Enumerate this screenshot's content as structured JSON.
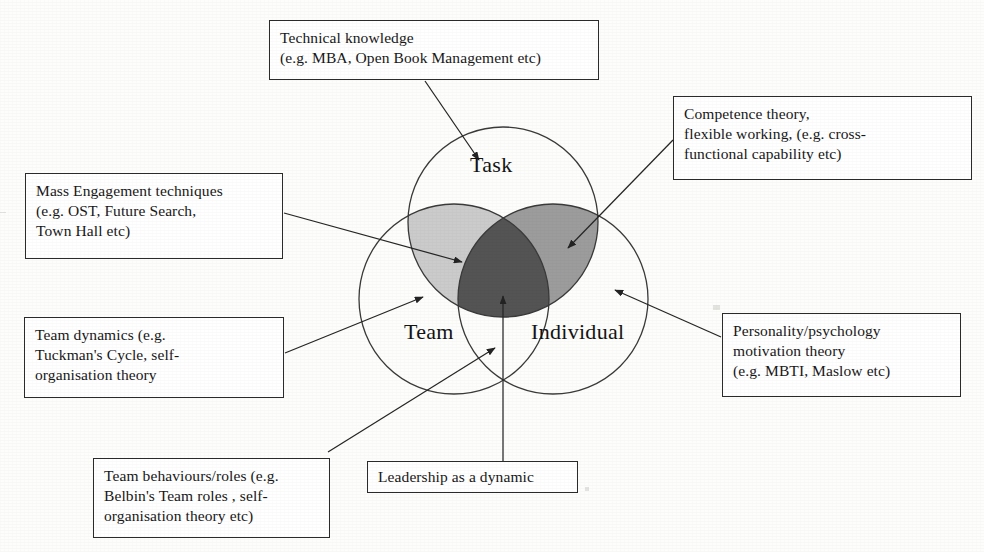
{
  "diagram": {
    "background_color": "#fdfdfb",
    "line_color": "#2b2b2b",
    "circles": [
      {
        "id": "task",
        "label": "Task",
        "cx": 503,
        "cy": 222,
        "r": 95,
        "label_x": 470,
        "label_y": 163
      },
      {
        "id": "team",
        "label": "Team",
        "cx": 454,
        "cy": 299,
        "r": 95,
        "label_x": 404,
        "label_y": 330
      },
      {
        "id": "individual",
        "label": "Individual",
        "cx": 553,
        "cy": 299,
        "r": 95,
        "label_x": 531,
        "label_y": 330
      }
    ],
    "overlap_colors": {
      "task_team": "#c9c9c9",
      "task_individual": "#9a9a9a",
      "all_three": "#555555"
    }
  },
  "callouts": [
    {
      "id": "technical-knowledge",
      "text": "Technical knowledge\n(e.g. MBA, Open Book Management  etc)",
      "x": 269,
      "y": 20,
      "w": 330,
      "h": 60,
      "target": "Task circle"
    },
    {
      "id": "competence-theory",
      "text": "Competence theory,\nflexible working, (e.g. cross-\nfunctional capability etc)",
      "x": 673,
      "y": 96,
      "w": 299,
      "h": 84,
      "target": "Task and Individual overlap"
    },
    {
      "id": "mass-engagement",
      "text": "Mass Engagement  techniques\n(e.g. OST,  Future Search,\nTown Hall etc)",
      "x": 25,
      "y": 173,
      "w": 258,
      "h": 86,
      "target": "Task and Team overlap"
    },
    {
      "id": "team-dynamics",
      "text": "Team dynamics (e.g.\nTuckman's Cycle, self-\norganisation theory",
      "x": 24,
      "y": 317,
      "w": 260,
      "h": 81,
      "target": "Team circle"
    },
    {
      "id": "personality-psychology",
      "text": "Personality/psychology\nmotivation theory\n(e.g. MBTI, Maslow etc)",
      "x": 722,
      "y": 313,
      "w": 239,
      "h": 84,
      "target": "Individual circle"
    },
    {
      "id": "team-behaviours",
      "text": "Team behaviours/roles (e.g.\nBelbin's Team roles , self-\norganisation theory etc)",
      "x": 93,
      "y": 458,
      "w": 237,
      "h": 80,
      "target": "Team circle"
    },
    {
      "id": "leadership-dynamic",
      "text": "Leadership as a dynamic",
      "x": 367,
      "y": 461,
      "w": 211,
      "h": 32,
      "target": "Centre of all three circles"
    }
  ],
  "connectors": [
    {
      "id": "technical-knowledge-arrow",
      "from": [
        425,
        81
      ],
      "to": [
        479,
        160
      ]
    },
    {
      "id": "competence-theory-arrow",
      "from": [
        673,
        140
      ],
      "to": [
        568,
        248
      ]
    },
    {
      "id": "mass-engagement-arrow",
      "from": [
        284,
        213
      ],
      "to": [
        462,
        262
      ]
    },
    {
      "id": "team-dynamics-arrow",
      "from": [
        285,
        353
      ],
      "to": [
        423,
        297
      ]
    },
    {
      "id": "personality-psychology-arrow",
      "from": [
        721,
        337
      ],
      "to": [
        615,
        290
      ]
    },
    {
      "id": "team-behaviours-arrow",
      "from": [
        328,
        452
      ],
      "to": [
        495,
        348
      ]
    },
    {
      "id": "leadership-dynamic-arrow",
      "from": [
        503,
        461
      ],
      "to": [
        503,
        296
      ]
    }
  ]
}
